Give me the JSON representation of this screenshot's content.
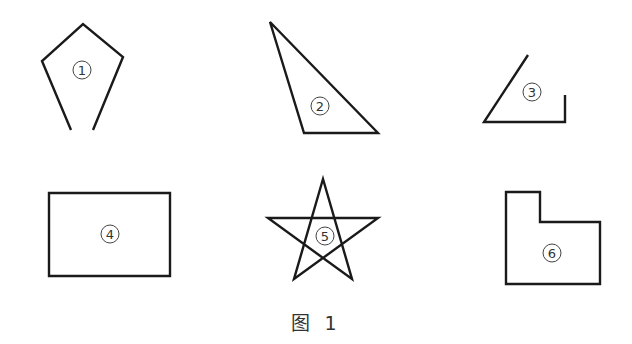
{
  "figure": {
    "caption": "图 1",
    "stroke_color": "#1a1a1a",
    "shapes": [
      {
        "id": 1,
        "label": "1",
        "name": "open-pentagon",
        "points": "71,130 42,61 83,24 123,57 93,130",
        "closed": false,
        "label_pos": [
          82,
          70
        ]
      },
      {
        "id": 2,
        "label": "2",
        "name": "triangle",
        "points": "270,22 304,133 378,133",
        "closed": true,
        "label_pos": [
          320,
          106
        ]
      },
      {
        "id": 3,
        "label": "3",
        "name": "open-angle",
        "points": "528,55 484,122 565,122 565,95",
        "closed": false,
        "label_pos": [
          532,
          92
        ]
      },
      {
        "id": 4,
        "label": "4",
        "name": "rectangle",
        "points": "49,193 170,193 170,276 49,276",
        "closed": true,
        "label_pos": [
          110,
          234
        ]
      },
      {
        "id": 5,
        "label": "5",
        "name": "five-pointed-star",
        "points": "323,179 352,279 268,218 378,218 294,279",
        "closed": true,
        "label_pos": [
          325,
          236
        ]
      },
      {
        "id": 6,
        "label": "6",
        "name": "l-shaped-hexagon",
        "points": "506,192 540,192 540,222 600,222 600,284 506,284",
        "closed": true,
        "label_pos": [
          552,
          253
        ]
      }
    ]
  }
}
